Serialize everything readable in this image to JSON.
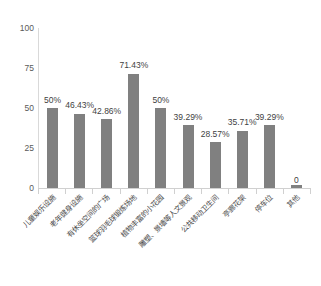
{
  "chart_data": {
    "type": "bar",
    "title": "",
    "subtitle": "",
    "xlabel": "",
    "ylabel": "",
    "ylim": [
      0,
      100
    ],
    "y_ticks": [
      "0",
      "25",
      "50",
      "75",
      "100"
    ],
    "grid": false,
    "legend": "none",
    "bar_color": "#808080",
    "categories": [
      "儿童娱乐设施",
      "老年健身设施",
      "有休坐空间的广场",
      "篮球羽毛球锻炼场地",
      "植物丰富的小花园",
      "雕塑、景墙等人文景观",
      "公共移动卫生间",
      "亭廊花架",
      "停车位",
      "其他"
    ],
    "values": [
      50,
      46.43,
      42.86,
      71.43,
      50,
      39.29,
      28.57,
      35.71,
      39.29,
      0
    ],
    "value_labels": [
      "50%",
      "46.43%",
      "42.86%",
      "71.43%",
      "50%",
      "39.29%",
      "28.57%",
      "35.71%",
      "39.29%",
      "0"
    ]
  }
}
